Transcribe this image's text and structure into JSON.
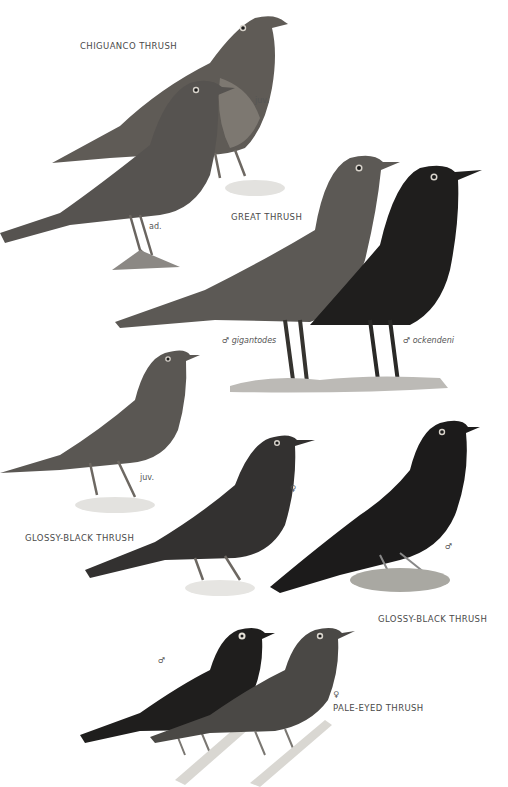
{
  "plate": {
    "species": [
      {
        "name": "CHIGUANCO THRUSH",
        "figures": [
          {
            "note": "juv."
          },
          {
            "note": "ad."
          }
        ]
      },
      {
        "name": "GREAT THRUSH",
        "figures": [
          {
            "sex": "♂",
            "subspecies": "gigantodes"
          },
          {
            "sex": "♂",
            "subspecies": "ockendeni"
          }
        ]
      },
      {
        "name": "GLOSSY-BLACK THRUSH",
        "figures": [
          {
            "note": "juv."
          },
          {
            "sex": "♀"
          }
        ]
      },
      {
        "name": "GLOSSY-BLACK THRUSH",
        "figures": [
          {
            "sex": "♂"
          }
        ]
      },
      {
        "name": "PALE-EYED THRUSH",
        "figures": [
          {
            "sex": "♂"
          },
          {
            "sex": "♀"
          }
        ]
      }
    ]
  },
  "colors": {
    "background": "#ffffff",
    "brown_grey": "#5e5a55",
    "dark_grey": "#3c3a38",
    "black": "#1c1b1b",
    "label": "#4a4a4a"
  }
}
